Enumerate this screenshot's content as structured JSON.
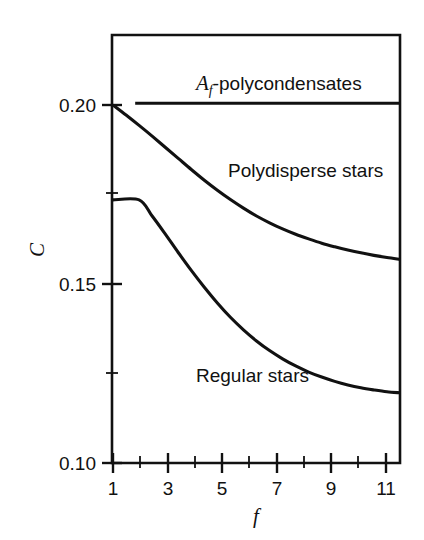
{
  "chart_data": {
    "type": "line",
    "title": "",
    "subtitle": "",
    "xlabel": "f",
    "ylabel": "C",
    "xlim": [
      1,
      12
    ],
    "ylim": [
      0.1,
      0.215
    ],
    "grid": false,
    "legend_position": "inline-annotations",
    "x_ticks_major": [
      1,
      3,
      5,
      7,
      9,
      11
    ],
    "x_ticks_major_labels": [
      "1",
      "3",
      "5",
      "7",
      "9",
      "11"
    ],
    "x_ticks_minor": [
      2,
      4,
      6,
      8,
      10,
      12
    ],
    "y_ticks_major": [
      0.1,
      0.15,
      0.2
    ],
    "y_ticks_major_labels": [
      "0.10",
      "0.15",
      "0.20"
    ],
    "y_ticks_minor": [
      0.125,
      0.175
    ],
    "series": [
      {
        "name": "A_f-polycondensates",
        "label_html": "<tspan class='ital'>A</tspan><tspan class='sub' dy='5'>f</tspan><tspan dy='-5'>-polycondensates</tspan>",
        "label_plain": "Af-polycondensates",
        "style": "flat-line",
        "x": [
          1.85,
          12.0
        ],
        "y": [
          0.2005,
          0.2005
        ]
      },
      {
        "name": "Polydisperse stars",
        "label_html": "Polydisperse stars",
        "label_plain": "Polydisperse stars",
        "style": "decaying-curve",
        "x": [
          1.0,
          1.5,
          2.0,
          2.5,
          3.0,
          3.5,
          4.0,
          4.5,
          5.0,
          5.5,
          6.0,
          6.5,
          7.0,
          7.5,
          8.0,
          8.5,
          9.0,
          9.5,
          10.0,
          10.5,
          11.0,
          11.5,
          12.0
        ],
        "y": [
          0.2,
          0.1972,
          0.1943,
          0.1913,
          0.1882,
          0.1851,
          0.182,
          0.179,
          0.1762,
          0.1736,
          0.1712,
          0.169,
          0.1671,
          0.1654,
          0.1639,
          0.1626,
          0.1614,
          0.1604,
          0.1595,
          0.1587,
          0.158,
          0.1574,
          0.1569
        ]
      },
      {
        "name": "Regular stars",
        "label_html": "Regular stars",
        "label_plain": "Regular stars",
        "style": "plateau-then-decay",
        "x": [
          1.0,
          2.0,
          2.5,
          3.0,
          3.5,
          4.0,
          4.5,
          5.0,
          5.5,
          6.0,
          6.5,
          7.0,
          7.5,
          8.0,
          8.5,
          9.0,
          9.5,
          10.0,
          10.5,
          11.0,
          11.5,
          12.0
        ],
        "y": [
          0.1735,
          0.1735,
          0.169,
          0.164,
          0.1588,
          0.1538,
          0.1491,
          0.1447,
          0.1407,
          0.1372,
          0.1341,
          0.1314,
          0.1291,
          0.1271,
          0.1254,
          0.124,
          0.1228,
          0.1218,
          0.121,
          0.1204,
          0.1199,
          0.1196
        ]
      }
    ],
    "annotations": [
      {
        "text": "Af-polycondensates",
        "x_px": 196,
        "y_px": 90
      },
      {
        "text": "Polydisperse stars",
        "x_px": 228,
        "y_px": 177
      },
      {
        "text": "Regular stars",
        "x_px": 196,
        "y_px": 382
      }
    ]
  },
  "axes": {
    "y_label": "C",
    "x_label": "f",
    "y_tick_labels": [
      "0.20",
      "0.15",
      "0.10"
    ],
    "x_tick_labels": [
      "1",
      "3",
      "5",
      "7",
      "9",
      "11"
    ]
  },
  "colors": {
    "ink": "#111111",
    "background": "#ffffff"
  }
}
